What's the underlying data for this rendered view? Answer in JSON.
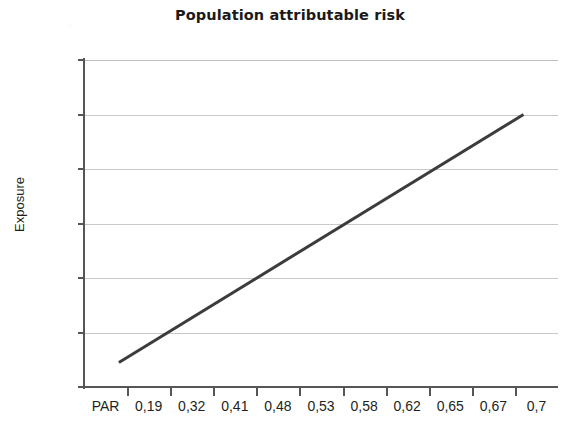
{
  "chart_data": {
    "type": "line",
    "title": "Population attributable risk",
    "xlabel": "",
    "ylabel": "Exposure",
    "grid": true,
    "legend": null,
    "x_tick_labels": [
      "PAR",
      "0,19",
      "0,32",
      "0,41",
      "0,48",
      "0,53",
      "0,58",
      "0,62",
      "0,65",
      "0,67",
      "0,7"
    ],
    "y_tick_labels": [
      "0",
      "0,2",
      "0,4",
      "0,6",
      "0,8",
      "1",
      "1,2"
    ],
    "y_tick_values": [
      0,
      0.2,
      0.4,
      0.6,
      0.8,
      1,
      1.2
    ],
    "ylim": [
      0,
      1.2
    ],
    "x_index_range": [
      0,
      10
    ],
    "categories": [
      "PAR",
      "0,19",
      "0,32",
      "0,41",
      "0,48",
      "0,53",
      "0,58",
      "0,62",
      "0,65",
      "0,67",
      "0,7"
    ],
    "series": [
      {
        "name": "Exposure",
        "color": "#3c3c3c",
        "line_width": 3,
        "points": [
          {
            "x_index": 0.31,
            "y": 0.09
          },
          {
            "x_index": 9.7,
            "y": 1.0
          }
        ],
        "values": [
          0.09,
          0.18,
          0.28,
          0.37,
          0.46,
          0.55,
          0.64,
          0.73,
          0.82,
          0.91,
          1.0
        ]
      }
    ],
    "colors": {
      "line": "#3c3c3c",
      "axis": "#565656",
      "grid": "#c9c9c9",
      "text": "#231f20",
      "background": "#ffffff"
    }
  }
}
